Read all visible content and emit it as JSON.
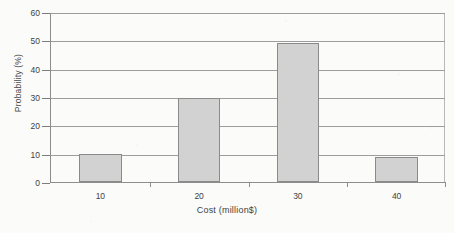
{
  "chart_data": {
    "type": "bar",
    "title": "",
    "subtitle": "",
    "xlabel": "Cost (million$)",
    "ylabel": "Probability (%)",
    "categories": [
      "10",
      "20",
      "30",
      "40"
    ],
    "values": [
      10,
      29.5,
      49,
      9
    ],
    "series": [
      {
        "name": "Probability",
        "values": [
          10,
          29.5,
          49,
          9
        ]
      }
    ],
    "ylim": [
      0,
      60
    ],
    "ytick_labels": [
      "0",
      "10",
      "20",
      "30",
      "40",
      "50",
      "60"
    ],
    "ytick_values": [
      0,
      10,
      20,
      30,
      40,
      50,
      60
    ],
    "xtick_labels": [
      "10",
      "20",
      "30",
      "40"
    ],
    "grid": "horizontal",
    "legend": "none",
    "annotations": [],
    "colors": {
      "bar_fill": "#d2d2d2",
      "bar_border": "#8a8a8a",
      "gridline": "#9d9d9d",
      "axis": "#8d8d8d",
      "text": "#3f3f3f",
      "background": "#fbfbfa"
    }
  }
}
